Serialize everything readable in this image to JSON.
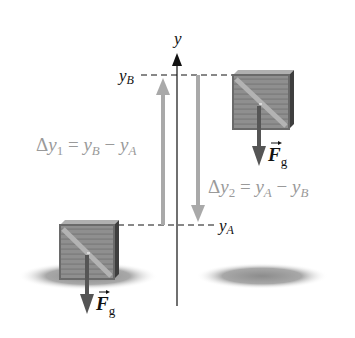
{
  "diagram": {
    "axis_label": "y",
    "level_top_label": "y",
    "level_top_sub": "B",
    "level_bottom_label": "y",
    "level_bottom_sub": "A",
    "eq1": {
      "delta": "Δ",
      "var": "y",
      "sub": "1",
      "eq": " = ",
      "t1": "y",
      "t1sub": "B",
      "minus": " − ",
      "t2": "y",
      "t2sub": "A"
    },
    "eq2": {
      "delta": "Δ",
      "var": "y",
      "sub": "2",
      "eq": " = ",
      "t1": "y",
      "t1sub": "A",
      "minus": " − ",
      "t2": "y",
      "t2sub": "B"
    },
    "force_top": {
      "symbol": "F",
      "sub": "g"
    },
    "force_bottom": {
      "symbol": "F",
      "sub": "g"
    },
    "colors": {
      "axis": "#111111",
      "displacement_arrow": "#a9a9a9",
      "equation_text": "#9a9a9a",
      "force_arrow": "#555555",
      "crate": "#8a8a8a",
      "shadow": "#9a9a9a"
    }
  }
}
